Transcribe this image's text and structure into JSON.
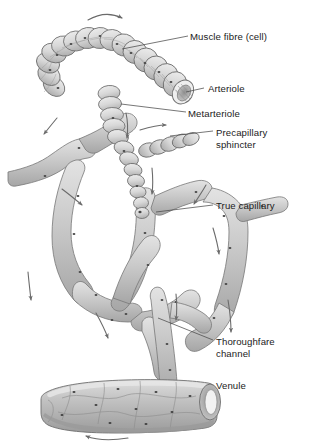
{
  "figure": {
    "background_color": "#ffffff",
    "vessel_fill": "#c9c9c9",
    "vessel_fill_light": "#dcdcdc",
    "vessel_fill_dark": "#a8a8a8",
    "outline_color": "#6e6e6e",
    "nucleus_color": "#4a4a4a",
    "label_color": "#1b1b1b",
    "leader_color": "#4a4a4a",
    "arrow_color": "#6b6b6b"
  },
  "labels": [
    {
      "id": "muscle-fibre",
      "text": "Muscle fibre (cell)",
      "x": 190,
      "y": 37
    },
    {
      "id": "arteriole",
      "text": "Arteriole",
      "x": 208,
      "y": 89
    },
    {
      "id": "metarteriole",
      "text": "Metarteriole",
      "x": 188,
      "y": 114
    },
    {
      "id": "precapillary-sphincter-1",
      "text": "Precapillary",
      "x": 216,
      "y": 133
    },
    {
      "id": "precapillary-sphincter-2",
      "text": "sphincter",
      "x": 216,
      "y": 145
    },
    {
      "id": "true-capillary",
      "text": "True capillary",
      "x": 216,
      "y": 206
    },
    {
      "id": "thoroughfare-channel-1",
      "text": "Thoroughfare",
      "x": 216,
      "y": 342
    },
    {
      "id": "thoroughfare-channel-2",
      "text": "channel",
      "x": 216,
      "y": 354
    },
    {
      "id": "venule",
      "text": "Venule",
      "x": 216,
      "y": 386
    }
  ],
  "structures": [
    {
      "id": "arteriole",
      "name": "Arteriole"
    },
    {
      "id": "metarteriole",
      "name": "Metarteriole"
    },
    {
      "id": "precapillary-sphincter",
      "name": "Precapillary sphincter"
    },
    {
      "id": "true-capillary",
      "name": "True capillary"
    },
    {
      "id": "thoroughfare-channel",
      "name": "Thoroughfare channel"
    },
    {
      "id": "venule",
      "name": "Venule"
    },
    {
      "id": "muscle-fibre",
      "name": "Muscle fibre (cell)"
    }
  ],
  "flow_arrows": [
    {
      "id": "inflow-top",
      "direction": "right"
    },
    {
      "id": "branch-left-upper",
      "direction": "down-left"
    },
    {
      "id": "metarteriole-down",
      "direction": "down"
    },
    {
      "id": "sphincter-right",
      "direction": "right"
    },
    {
      "id": "network-left",
      "direction": "down-left"
    },
    {
      "id": "network-mid",
      "direction": "down"
    },
    {
      "id": "network-right",
      "direction": "down-right"
    },
    {
      "id": "capillary-left",
      "direction": "down"
    },
    {
      "id": "capillary-lower",
      "direction": "down-right"
    },
    {
      "id": "thoroughfare-down",
      "direction": "down"
    },
    {
      "id": "right-descend",
      "direction": "down"
    },
    {
      "id": "venule-outflow",
      "direction": "left"
    }
  ]
}
